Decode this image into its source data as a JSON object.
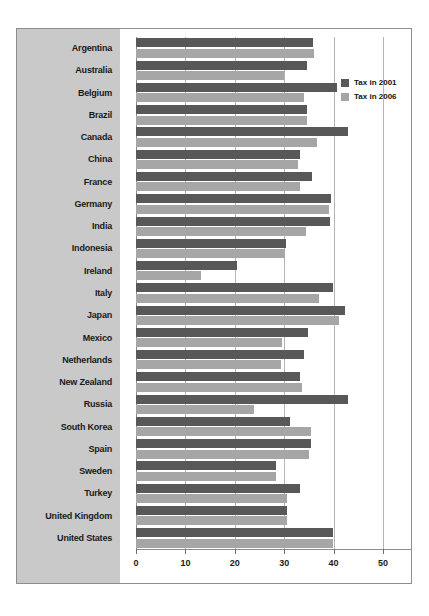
{
  "chart_data": {
    "type": "bar",
    "orientation": "horizontal",
    "title": "",
    "xlabel": "",
    "ylabel": "",
    "xlim": [
      0,
      50
    ],
    "xticks": [
      0,
      10,
      20,
      30,
      40,
      50
    ],
    "xtick_labels": [
      "0",
      "10",
      "20",
      "30",
      "40",
      "50"
    ],
    "grid": true,
    "legend_position": "right-top",
    "categories": [
      "Argentina",
      "Australia",
      "Belgium",
      "Brazil",
      "Canada",
      "China",
      "France",
      "Germany",
      "India",
      "Indonesia",
      "Ireland",
      "Italy",
      "Japan",
      "Mexico",
      "Netherlands",
      "New Zealand",
      "Russia",
      "South Korea",
      "Spain",
      "Sweden",
      "Turkey",
      "United Kingdom",
      "United States"
    ],
    "series": [
      {
        "name": "Tax in 2001",
        "color": "#585858",
        "values": [
          35.8,
          34.7,
          40.7,
          34.7,
          42.9,
          33.2,
          35.7,
          39.5,
          39.3,
          30.4,
          20.4,
          39.8,
          42.3,
          34.8,
          34.1,
          33.2,
          42.9,
          31.1,
          35.4,
          28.4,
          33.2,
          30.5,
          39.9
        ]
      },
      {
        "name": "Tax in 2006",
        "color": "#a6a6a6",
        "values": [
          36.0,
          30.0,
          34.1,
          34.7,
          36.6,
          32.7,
          33.2,
          39.0,
          34.4,
          30.2,
          13.2,
          37.1,
          41.0,
          29.5,
          29.4,
          33.6,
          23.9,
          35.4,
          35.1,
          28.3,
          30.5,
          30.5,
          39.9
        ]
      }
    ]
  },
  "legend": {
    "items": [
      {
        "label": "Tax in 2001",
        "color": "#585858"
      },
      {
        "label": "Tax in 2006",
        "color": "#a6a6a6"
      }
    ]
  },
  "colors": {
    "panel_background": "#c9c9c9",
    "frame_border": "#8d8d8d",
    "gridline": "#b5b5b5",
    "series_2001": "#585858",
    "series_2006": "#a6a6a6",
    "page_background": "#ffffff"
  }
}
